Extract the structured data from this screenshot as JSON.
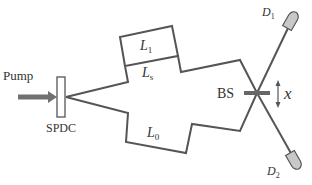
{
  "diagram": {
    "type": "Franson-type interferometer (two-photon interference setup)",
    "labels": {
      "pump": "Pump",
      "spdc": "SPDC",
      "l1": "L",
      "l1_sub": "1",
      "ls": "L",
      "ls_sub": "s",
      "l0": "L",
      "l0_sub": "0",
      "bs": "BS",
      "x": "x",
      "d1": "D",
      "d1_sub": "1",
      "d2": "D",
      "d2_sub": "2"
    },
    "colors": {
      "line": "#555555",
      "detector_fill": "#c8c8c8",
      "pump_arrow": "#707070",
      "text": "#333333"
    }
  }
}
